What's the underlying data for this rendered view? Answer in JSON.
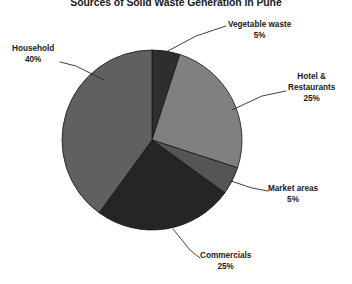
{
  "chart_data": {
    "type": "pie",
    "title": "Sources of Solid Waste Generation in Pune",
    "xlabel": "",
    "ylabel": "",
    "legend_position": "callout-labels",
    "grid": false,
    "categories": [
      "Vegetable waste",
      "Hotel & Restaurants",
      "Market areas",
      "Commercials",
      "Household"
    ],
    "values": [
      5,
      25,
      5,
      25,
      40
    ],
    "unit": "%",
    "total": 100,
    "slices": [
      {
        "label": "Vegetable waste",
        "value": 5,
        "value_text": "5%",
        "color": "#2e2e2e",
        "start_angle": 0,
        "end_angle": 18
      },
      {
        "label": "Hotel & Restaurants",
        "value": 25,
        "value_text": "25%",
        "color": "#808080",
        "start_angle": 18,
        "end_angle": 108
      },
      {
        "label": "Market areas",
        "value": 5,
        "value_text": "5%",
        "color": "#555555",
        "start_angle": 108,
        "end_angle": 126
      },
      {
        "label": "Commercials",
        "value": 25,
        "value_text": "25%",
        "color": "#252525",
        "start_angle": 126,
        "end_angle": 216
      },
      {
        "label": "Household",
        "value": 40,
        "value_text": "40%",
        "color": "#606060",
        "start_angle": 216,
        "end_angle": 360
      }
    ],
    "callouts": {
      "vegetable": {
        "label": "Vegetable waste",
        "value_text": "5%"
      },
      "hotel": {
        "label_line1": "Hotel &",
        "label_line2": "Restaurants",
        "value_text": "25%"
      },
      "market": {
        "label": "Market areas",
        "value_text": "5%"
      },
      "commercial": {
        "label": "Commercials",
        "value_text": "25%"
      },
      "household": {
        "label": "Household",
        "value_text": "40%"
      }
    },
    "colors": {
      "vegetable_waste": "#2e2e2e",
      "hotel_restaurants": "#808080",
      "market_areas": "#555555",
      "commercials": "#252525",
      "household": "#606060",
      "outline": "#151515",
      "leader_line": "#2b2b2b",
      "background": "#ffffff",
      "text": "#1a1a1a"
    }
  }
}
